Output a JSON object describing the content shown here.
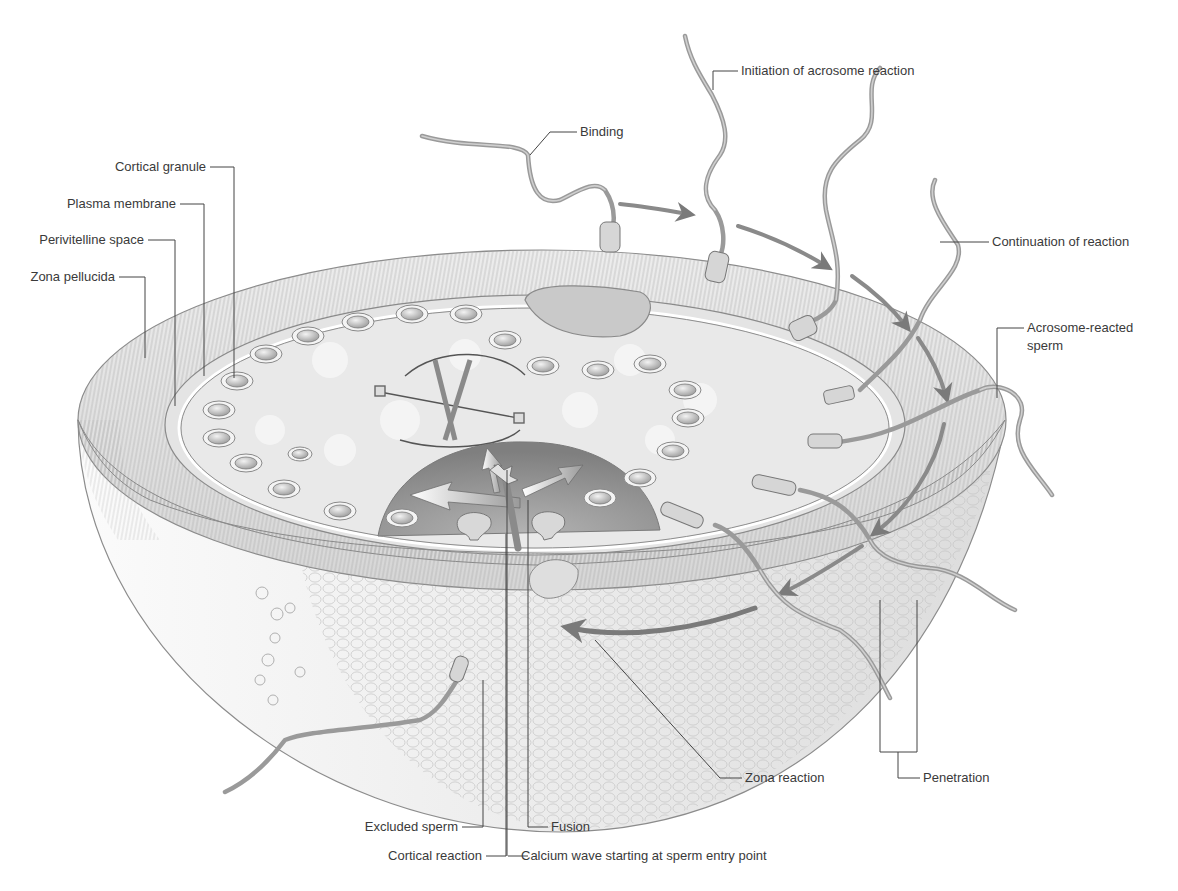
{
  "figure": {
    "colors": {
      "background": "#ffffff",
      "zona_band": "#e2e2e2",
      "zona_striation": "#9c9c9c",
      "ooplasm": "#e9e9e9",
      "calcium_wave": "#8f8f8f",
      "sperm_tail": "#9a9a9a",
      "outer_cells": "#efefef",
      "label_text": "#3a3a3a",
      "leader_line": "#444444"
    }
  },
  "labels": {
    "left": {
      "cortical_granule": "Cortical granule",
      "plasma_membrane": "Plasma membrane",
      "perivitelline_space": "Perivitelline space",
      "zona_pellucida": "Zona pellucida"
    },
    "top": {
      "binding": "Binding",
      "initiation": "Initiation of acrosome reaction",
      "continuation": "Continuation of reaction",
      "acrosome_reacted_line1": "Acrosome-reacted",
      "acrosome_reacted_line2": "sperm"
    },
    "bottom": {
      "zona_reaction": "Zona reaction",
      "penetration": "Penetration",
      "excluded_sperm": "Excluded sperm",
      "fusion": "Fusion",
      "cortical_reaction": "Cortical reaction",
      "calcium_wave": "Calcium wave starting at sperm entry point"
    }
  },
  "structures": [
    {
      "name": "zona-pellucida",
      "description": "striated outer glycoprotein layer"
    },
    {
      "name": "perivitelline-space",
      "description": "gap between zona and plasma membrane"
    },
    {
      "name": "plasma-membrane",
      "description": "oocyte membrane"
    },
    {
      "name": "cortical-granules",
      "count": 24
    },
    {
      "name": "polar-body",
      "count": 1
    },
    {
      "name": "meiotic-spindle",
      "count": 1
    },
    {
      "name": "calcium-wave-region",
      "arrows": 3
    },
    {
      "name": "corona-cells",
      "description": "cellular outer shell of hemisphere"
    },
    {
      "name": "sperm-sequence",
      "count": 7
    }
  ]
}
